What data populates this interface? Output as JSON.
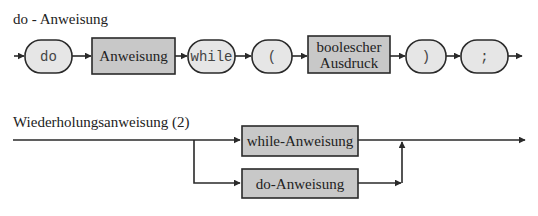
{
  "colors": {
    "line": "#2a2a2a",
    "pill_fill": "#e6e6e6",
    "box_fill": "#c8c8c8",
    "background": "#ffffff"
  },
  "diagram1": {
    "title": "do - Anweisung",
    "elements": [
      {
        "kind": "terminal",
        "label": "do"
      },
      {
        "kind": "nonterminal",
        "label": "Anweisung"
      },
      {
        "kind": "terminal",
        "label": "while"
      },
      {
        "kind": "terminal",
        "label": "("
      },
      {
        "kind": "nonterminal",
        "label_line1": "boolescher",
        "label_line2": "Ausdruck"
      },
      {
        "kind": "terminal",
        "label": ")"
      },
      {
        "kind": "terminal",
        "label": ";"
      }
    ]
  },
  "diagram2": {
    "title": "Wiederholungsanweisung (2)",
    "branches": [
      {
        "kind": "nonterminal",
        "label": "while-Anweisung"
      },
      {
        "kind": "nonterminal",
        "label": "do-Anweisung"
      }
    ]
  }
}
